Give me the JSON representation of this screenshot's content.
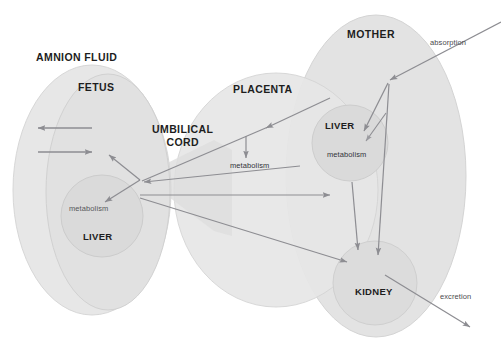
{
  "diagram": {
    "canvas": {
      "width": 501,
      "height": 347,
      "background": "#ffffff"
    },
    "palette": {
      "compartment_fill": "#e4e4e4",
      "compartment_fill_light": "#eaeaea",
      "compartment_stroke": "#d2d2d2",
      "organ_fill": "#dcdcdc",
      "organ_stroke": "#cfcfcf",
      "cord_fill": "#dedede",
      "arrow": "#8d8d92",
      "label_dark": "#1d1d1d",
      "label_gray": "#58585a"
    },
    "compartments": [
      {
        "id": "amnion-fluid",
        "label": "AMNION FLUID",
        "label_x": 36,
        "label_y": 58
      },
      {
        "id": "fetus",
        "label": "FETUS",
        "label_x": 78,
        "label_y": 88
      },
      {
        "id": "placenta",
        "label": "PLACENTA",
        "label_x": 233,
        "label_y": 90
      },
      {
        "id": "mother",
        "label": "MOTHER",
        "label_x": 347,
        "label_y": 35
      }
    ],
    "connector": {
      "id": "umbilical-cord",
      "label": "UMBILICAL\nCORD",
      "line1": "UMBILICAL",
      "line2": "CORD",
      "label_x": 158,
      "label_y": 128
    },
    "organs": [
      {
        "id": "fetal-liver",
        "label": "LIVER",
        "label_x": 83,
        "label_y": 236,
        "process": "metabolism",
        "process_x": 69,
        "process_y": 208
      },
      {
        "id": "maternal-liver",
        "label": "LIVER",
        "label_x": 325,
        "label_y": 125,
        "process": "metabolism",
        "process_x": 327,
        "process_y": 155
      },
      {
        "id": "maternal-kidney",
        "label": "KIDNEY",
        "label_x": 355,
        "label_y": 291,
        "process": null,
        "process_x": 0,
        "process_y": 0
      }
    ],
    "processes": [
      {
        "id": "placental-metabolism",
        "label": "metabolism",
        "x": 230,
        "y": 166
      }
    ],
    "flows": [
      {
        "id": "absorption",
        "label": "absorption",
        "x": 430,
        "y": 42
      },
      {
        "id": "excretion",
        "label": "excretion",
        "x": 440,
        "y": 297
      }
    ],
    "arrow_groups": [
      {
        "id": "amnion-exchange-arrows",
        "count": 2,
        "description": "bidirectional amnion fluid exchange"
      },
      {
        "id": "cord-transfer-arrows",
        "count": 4,
        "description": "umbilical cord bidirectional transfer"
      },
      {
        "id": "maternal-distribution-arrows",
        "count": 4,
        "description": "absorption to liver, kidney and placenta"
      },
      {
        "id": "fetal-liver-arrows",
        "count": 2,
        "description": "fetal hepatic uptake and return"
      }
    ]
  }
}
